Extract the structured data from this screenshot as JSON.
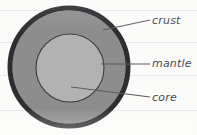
{
  "diagram": {
    "background_color": "#fbfbfa",
    "rule_line_color": "#e8e8ea",
    "rule_line_positions": [
      10,
      42,
      75,
      110
    ],
    "layers": [
      {
        "key": "crust",
        "label": "crust",
        "shape": "ring",
        "fill_color": "#8d8d8d",
        "stroke_color": "#2f2f33",
        "stroke_width": 5,
        "center_x": 69,
        "center_y": 67,
        "radius": 60
      },
      {
        "key": "mantle",
        "label": "mantle",
        "shape": "ring",
        "fill_color": "#8d8d8d",
        "stroke_color": "#3a3a3e",
        "stroke_width": 1,
        "center_x": 69,
        "center_y": 67,
        "radius": 60
      },
      {
        "key": "core",
        "label": "core",
        "shape": "circle",
        "fill_color": "#b2b2b2",
        "stroke_color": "#3a3a3e",
        "stroke_width": 1,
        "center_x": 70,
        "center_y": 68,
        "radius": 34
      }
    ],
    "labels": [
      {
        "key": "crust",
        "text": "crust",
        "text_color": "#4a4a4f",
        "x": 152,
        "y": 14,
        "leader_from_x": 104,
        "leader_from_y": 31,
        "leader_to_x": 150,
        "leader_to_y": 20
      },
      {
        "key": "mantle",
        "text": "mantle",
        "text_color": "#4a4a4f",
        "x": 152,
        "y": 57,
        "leader_from_x": 102,
        "leader_from_y": 64,
        "leader_to_x": 150,
        "leader_to_y": 64
      },
      {
        "key": "core",
        "text": "core",
        "text_color": "#4a4a4f",
        "x": 152,
        "y": 91,
        "leader_from_x": 72,
        "leader_from_y": 88,
        "leader_to_x": 150,
        "leader_to_y": 97
      }
    ]
  }
}
